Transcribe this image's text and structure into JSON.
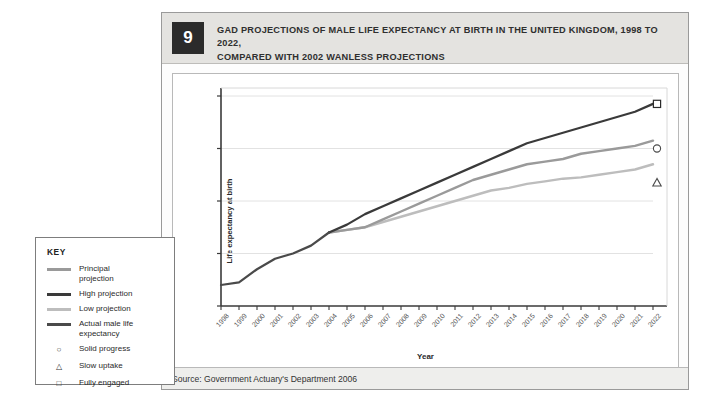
{
  "figure": {
    "number": "9",
    "title_line1": "GAD PROJECTIONS OF MALE LIFE EXPECTANCY AT BIRTH IN THE UNITED KINGDOM, 1998 TO 2022,",
    "title_line2": "COMPARED WITH 2002 WANLESS PROJECTIONS",
    "source": "Source: Government Actuary's Department 2006"
  },
  "key": {
    "title": "KEY",
    "lines": [
      {
        "label": "Principal\nprojection",
        "color": "#9a9a9a",
        "width": 3
      },
      {
        "label": "High projection",
        "color": "#3a3a3a",
        "width": 3
      },
      {
        "label": "Low projection",
        "color": "#bdbdbd",
        "width": 3
      },
      {
        "label": "Actual male life\nexpectancy",
        "color": "#4a4a4a",
        "width": 3
      }
    ],
    "markers": [
      {
        "glyph": "circle",
        "label": "Solid progress"
      },
      {
        "glyph": "triangle",
        "label": "Slow uptake"
      },
      {
        "glyph": "square",
        "label": "Fully engaged"
      }
    ]
  },
  "chart_data": {
    "type": "line",
    "title": "GAD PROJECTIONS OF MALE LIFE EXPECTANCY AT BIRTH IN THE UNITED KINGDOM, 1998 TO 2022, COMPARED WITH 2002 WANLESS PROJECTIONS",
    "xlabel": "Year",
    "ylabel": "Life expectancy at birth",
    "xlim": [
      1998,
      2022
    ],
    "ylim": [
      74,
      82
    ],
    "yticks": [
      74,
      76,
      78,
      80,
      82
    ],
    "grid": "horizontal",
    "legend_position": "external-left",
    "x": [
      1998,
      1999,
      2000,
      2001,
      2002,
      2003,
      2004,
      2005,
      2006,
      2007,
      2008,
      2009,
      2010,
      2011,
      2012,
      2013,
      2014,
      2015,
      2016,
      2017,
      2018,
      2019,
      2020,
      2021,
      2022
    ],
    "series": [
      {
        "name": "Actual male life expectancy",
        "color": "#4a4a4a",
        "values": [
          74.8,
          74.9,
          75.4,
          75.8,
          76.0,
          76.3,
          76.8,
          null,
          null,
          null,
          null,
          null,
          null,
          null,
          null,
          null,
          null,
          null,
          null,
          null,
          null,
          null,
          null,
          null,
          null
        ]
      },
      {
        "name": "High projection",
        "color": "#3a3a3a",
        "values": [
          null,
          null,
          null,
          null,
          null,
          null,
          76.8,
          77.1,
          77.5,
          77.8,
          78.1,
          78.4,
          78.7,
          79.0,
          79.3,
          79.6,
          79.9,
          80.2,
          80.4,
          80.6,
          80.8,
          81.0,
          81.2,
          81.4,
          81.7
        ]
      },
      {
        "name": "Principal projection",
        "color": "#9a9a9a",
        "values": [
          null,
          null,
          null,
          null,
          null,
          null,
          76.8,
          76.9,
          77.0,
          77.3,
          77.6,
          77.9,
          78.2,
          78.5,
          78.8,
          79.0,
          79.2,
          79.4,
          79.5,
          79.6,
          79.8,
          79.9,
          80.0,
          80.1,
          80.3
        ]
      },
      {
        "name": "Low projection",
        "color": "#bdbdbd",
        "values": [
          null,
          null,
          null,
          null,
          null,
          null,
          76.8,
          76.9,
          77.0,
          77.2,
          77.4,
          77.6,
          77.8,
          78.0,
          78.2,
          78.4,
          78.5,
          78.65,
          78.75,
          78.85,
          78.9,
          79.0,
          79.1,
          79.2,
          79.4
        ]
      }
    ],
    "annotation_markers": [
      {
        "glyph": "square",
        "label": "Fully engaged",
        "x": 2022,
        "y": 81.7
      },
      {
        "glyph": "circle",
        "label": "Solid progress",
        "x": 2022,
        "y": 80.0
      },
      {
        "glyph": "triangle",
        "label": "Slow uptake",
        "x": 2022,
        "y": 78.7
      }
    ]
  }
}
